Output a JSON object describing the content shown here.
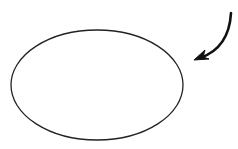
{
  "diagram": {
    "background": "#ffffff",
    "stroke_color": "#222222",
    "shapes": [
      {
        "type": "ellipse",
        "name": "ellipse",
        "cx": 97,
        "cy": 85,
        "rx": 86,
        "ry": 55,
        "fill": "none",
        "stroke_width": 1.3
      },
      {
        "type": "curved-arrow",
        "name": "curved-arrow",
        "start": [
          231,
          13
        ],
        "control": [
          228,
          48
        ],
        "end": [
          197,
          59
        ],
        "stroke_width": 2.5,
        "direction": "down-left"
      }
    ]
  }
}
